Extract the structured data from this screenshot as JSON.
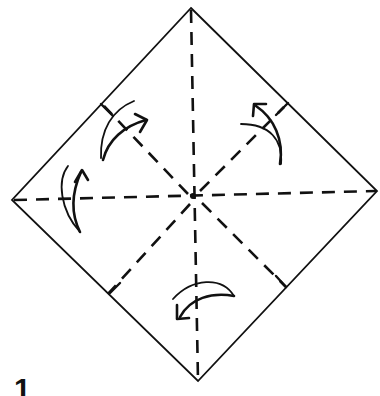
{
  "diagram": {
    "type": "origami-fold-diagram",
    "step_number": "1",
    "colors": {
      "ink": "#111111",
      "paper": "#ffffff"
    },
    "vertices": {
      "top": [
        191,
        8
      ],
      "right": [
        377,
        191
      ],
      "bottom": [
        198,
        381
      ],
      "left": [
        12,
        200
      ],
      "center": [
        194,
        197
      ]
    },
    "creases": [
      {
        "name": "vertical-diagonal",
        "style": "dashed",
        "from": "top",
        "to": "bottom"
      },
      {
        "name": "horizontal-diagonal",
        "style": "dashed",
        "from": "left",
        "to": "right"
      },
      {
        "name": "upper-left-midline",
        "style": "dashed",
        "from": "center",
        "to": "upper-left-edge-midpoint"
      },
      {
        "name": "upper-right-midline",
        "style": "dashed",
        "from": "center",
        "to": "upper-right-edge-midpoint"
      },
      {
        "name": "lower-left-midline",
        "style": "dashed",
        "from": "center",
        "to": "lower-left-edge-midpoint"
      },
      {
        "name": "lower-right-midline",
        "style": "dashed",
        "from": "center",
        "to": "lower-right-edge-midpoint"
      }
    ],
    "arrows": [
      {
        "name": "upper-left-fold-arrow",
        "direction": "curving up-right"
      },
      {
        "name": "upper-right-fold-arrow",
        "direction": "curving up-left"
      },
      {
        "name": "left-fold-arrow",
        "direction": "curving upward"
      },
      {
        "name": "bottom-fold-arrow",
        "direction": "curving down-left"
      }
    ]
  }
}
